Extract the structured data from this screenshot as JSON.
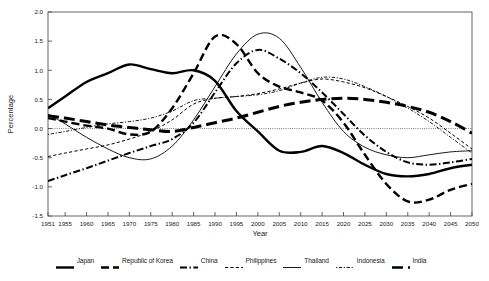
{
  "chart_data": {
    "type": "line",
    "title": "",
    "xlabel": "Year",
    "ylabel": "Percentage",
    "xlim": [
      1951,
      2050
    ],
    "ylim": [
      -1.5,
      2.0
    ],
    "ytick_step": 0.5,
    "grid": false,
    "legend_position": "bottom",
    "zero_line": true,
    "xtick_labels": [
      "1951",
      "1955",
      "1960",
      "1965",
      "1970",
      "1975",
      "1980",
      "1985",
      "1990",
      "1995",
      "2000",
      "2005",
      "2010",
      "2015",
      "2020",
      "2025",
      "2030",
      "2035",
      "2040",
      "2045",
      "2050"
    ],
    "ytick_labels": [
      "2.0",
      "1.5",
      "1.0",
      "0.5",
      "0.0",
      "-0.5",
      "-1.0",
      "-1.5"
    ],
    "x": [
      1951,
      1955,
      1960,
      1965,
      1970,
      1975,
      1980,
      1985,
      1990,
      1995,
      2000,
      2005,
      2010,
      2015,
      2020,
      2025,
      2030,
      2035,
      2040,
      2045,
      2050
    ],
    "series": [
      {
        "name": "Japan",
        "style": "solid-thick",
        "width": 2.4,
        "color": "#000000",
        "values": [
          0.35,
          0.55,
          0.8,
          0.95,
          1.1,
          1.02,
          0.95,
          1.0,
          0.82,
          0.3,
          -0.05,
          -0.38,
          -0.4,
          -0.3,
          -0.42,
          -0.62,
          -0.78,
          -0.82,
          -0.78,
          -0.68,
          -0.62
        ]
      },
      {
        "name": "Republic of Korea",
        "style": "dash-long-thick",
        "width": 2.4,
        "color": "#000000",
        "values": [
          0.18,
          0.12,
          0.05,
          0.0,
          -0.1,
          -0.05,
          0.35,
          0.95,
          1.58,
          1.45,
          0.95,
          0.72,
          0.62,
          0.48,
          0.1,
          -0.45,
          -0.95,
          -1.25,
          -1.22,
          -1.05,
          -0.95
        ]
      },
      {
        "name": "China",
        "style": "dash-dot-thick",
        "width": 2.0,
        "color": "#000000",
        "values": [
          -0.9,
          -0.8,
          -0.68,
          -0.55,
          -0.42,
          -0.3,
          -0.18,
          0.1,
          0.62,
          1.12,
          1.35,
          1.2,
          0.95,
          0.62,
          0.25,
          -0.12,
          -0.4,
          -0.58,
          -0.62,
          -0.58,
          -0.52
        ]
      },
      {
        "name": "Philippines",
        "style": "dash-short-thin",
        "width": 1.0,
        "color": "#000000",
        "values": [
          -0.48,
          -0.42,
          -0.35,
          -0.28,
          -0.18,
          -0.05,
          0.15,
          0.42,
          0.52,
          0.55,
          0.6,
          0.68,
          0.78,
          0.85,
          0.8,
          0.7,
          0.55,
          0.38,
          0.18,
          -0.08,
          -0.35
        ]
      },
      {
        "name": "Thailand",
        "style": "solid-thin",
        "width": 0.9,
        "color": "#000000",
        "values": [
          0.25,
          0.08,
          -0.15,
          -0.35,
          -0.5,
          -0.52,
          -0.3,
          0.15,
          0.72,
          1.28,
          1.62,
          1.55,
          1.05,
          0.45,
          -0.05,
          -0.32,
          -0.45,
          -0.5,
          -0.45,
          -0.4,
          -0.38
        ]
      },
      {
        "name": "Indonesia",
        "style": "dot-fine",
        "width": 0.9,
        "color": "#000000",
        "values": [
          -0.1,
          -0.05,
          0.02,
          0.08,
          0.12,
          0.18,
          0.3,
          0.48,
          0.52,
          0.55,
          0.58,
          0.65,
          0.78,
          0.88,
          0.85,
          0.72,
          0.55,
          0.35,
          0.12,
          -0.15,
          -0.42
        ]
      },
      {
        "name": "India",
        "style": "dash-vlong-thick",
        "width": 3.0,
        "color": "#000000",
        "values": [
          0.22,
          0.18,
          0.12,
          0.06,
          0.02,
          -0.02,
          -0.05,
          0.02,
          0.1,
          0.18,
          0.28,
          0.38,
          0.45,
          0.5,
          0.52,
          0.5,
          0.45,
          0.38,
          0.28,
          0.12,
          -0.08
        ]
      }
    ]
  },
  "legend": {
    "items": [
      {
        "label": "Japan"
      },
      {
        "label": "Republic of Korea"
      },
      {
        "label": "China"
      },
      {
        "label": "Philippines"
      },
      {
        "label": "Thailand"
      },
      {
        "label": "Indonesia"
      },
      {
        "label": "India"
      }
    ]
  }
}
